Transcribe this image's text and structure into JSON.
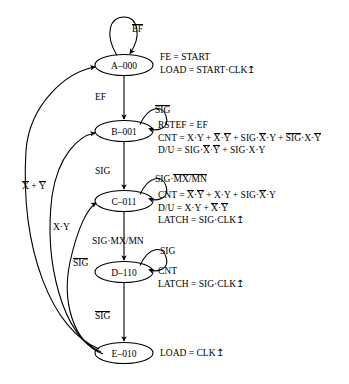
{
  "diagram": {
    "type": "state-machine",
    "states": [
      {
        "id": "A",
        "label": "A–000",
        "name": "A",
        "code": "000"
      },
      {
        "id": "B",
        "label": "B–001",
        "name": "B",
        "code": "001"
      },
      {
        "id": "C",
        "label": "C–011",
        "name": "C",
        "code": "011"
      },
      {
        "id": "D",
        "label": "D–110",
        "name": "D",
        "code": "110"
      },
      {
        "id": "E",
        "label": "E–010",
        "name": "E",
        "code": "010"
      }
    ],
    "outputs": {
      "A": [
        "FE = START",
        "LOAD = START·CLK↥"
      ],
      "B": [
        "RSTEF = EF",
        "CNT = X·Y + X̅·Y̅ + SIG·X̅·Y + SIG̅·X·Y̅",
        "D/U = SIG·X̅·Y̅ + SIG·X·Y"
      ],
      "C": [
        "CNT = X̅·Y̅ + X·Y + SIG·X̅·Y",
        "D/U = X·Y + X̅·Y̅",
        "LATCH = SIG·CLK↥"
      ],
      "D": [
        "CNT",
        "LATCH = SIG·CLK↥"
      ],
      "E": [
        "LOAD = CLK↥"
      ]
    },
    "self_loops": [
      {
        "state": "A",
        "label": "EF",
        "overbar": true
      },
      {
        "state": "B",
        "label": "SIG",
        "overbar": true
      },
      {
        "state": "C",
        "label": "SIG·MX/MN",
        "overbar": false
      },
      {
        "state": "D",
        "label": "SIG",
        "overbar": false
      }
    ],
    "transitions": [
      {
        "from": "A",
        "to": "B",
        "label": "EF"
      },
      {
        "from": "B",
        "to": "C",
        "label": "SIG"
      },
      {
        "from": "C",
        "to": "D",
        "label": "SIG·MX/MN"
      },
      {
        "from": "D",
        "to": "E",
        "label": "SIG"
      },
      {
        "from": "E",
        "to": "A",
        "label": "X̅ + Y̅"
      },
      {
        "from": "E",
        "to": "B",
        "label": "X·Y"
      },
      {
        "from": "E",
        "to": "C",
        "label": "SIG"
      }
    ]
  },
  "labels": {
    "a_eq_1": "FE = START",
    "a_eq_2_pre": "LOAD = START·CLK",
    "a_loop": "EF",
    "a_to_b": "EF",
    "b_loop": "SIG",
    "b_eq_1": "RSTEF = EF",
    "b_cnt_head": "CNT = X·Y + ",
    "b_cnt_x1": "X",
    "b_cnt_mid1": "·",
    "b_cnt_y1": "Y",
    "b_cnt_plus1": " + SIG·",
    "b_cnt_x2": "X",
    "b_cnt_tail1": "·Y + ",
    "b_cnt_sig": "SIG",
    "b_cnt_mid2": "·X·",
    "b_cnt_y2": "Y",
    "b_du_head": "D/U = SIG·",
    "b_du_x": "X",
    "b_du_dot": "·",
    "b_du_y": "Y",
    "b_du_tail": " + SIG·X·Y",
    "b_to_c": "SIG",
    "c_loop_head": "SIG·",
    "c_loop_bar": "MX/MN",
    "c_cnt_head": "CNT = ",
    "c_cnt_x1": "X",
    "c_cnt_dot1": "·",
    "c_cnt_y1": "Y",
    "c_cnt_mid": " + X·Y + SIG·",
    "c_cnt_x2": "X",
    "c_cnt_tail": "·Y",
    "c_du_head": "D/U = X·Y + ",
    "c_du_x": "X",
    "c_du_dot": "·",
    "c_du_y": "Y",
    "c_latch": "LATCH = SIG·CLK",
    "c_to_d": "SIG·MX/MN",
    "d_loop": "SIG",
    "d_cnt": "CNT",
    "d_latch": "LATCH = SIG·CLK",
    "d_to_e": "SIG",
    "e_eq": "LOAD = CLK",
    "e_to_a_x": "X",
    "e_to_a_plus": " + ",
    "e_to_a_y": "Y",
    "e_to_b": "X·Y",
    "e_to_c": "SIG",
    "clk_edge": "↥"
  },
  "style": {
    "stroke": "#000000",
    "background": "#ffffff"
  }
}
